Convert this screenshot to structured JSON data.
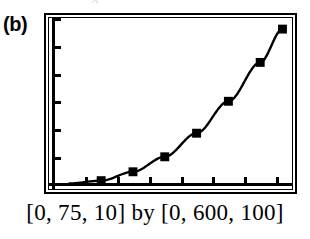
{
  "figure": {
    "panel_label": "(b)",
    "bleed_glyph": "x",
    "caption": "[0, 75, 10] by [0, 600, 100]"
  },
  "chart_data": {
    "type": "line",
    "title": "",
    "subtitle": "",
    "xlabel": "",
    "ylabel": "",
    "grid": false,
    "legend": false,
    "legend_position": "none",
    "marker": "filled-square",
    "line_style": "solid",
    "line_color": "#000000",
    "marker_color": "#000000",
    "background_color": "#ffffff",
    "window_notation": "[0, 75, 10] by [0, 600, 100]",
    "xlim": [
      0,
      75
    ],
    "ylim": [
      0,
      600
    ],
    "xtick_step": 10,
    "ytick_step": 100,
    "xticks": [
      0,
      10,
      20,
      30,
      40,
      50,
      60,
      70
    ],
    "yticks": [
      0,
      100,
      200,
      300,
      400,
      500,
      600
    ],
    "x": [
      5,
      15,
      25,
      35,
      45,
      55,
      65,
      72
    ],
    "y": [
      4,
      14,
      46,
      100,
      185,
      300,
      440,
      560
    ],
    "series": [
      {
        "name": "curve",
        "x": [
          5,
          15,
          25,
          35,
          45,
          55,
          65,
          72
        ],
        "y": [
          4,
          14,
          46,
          100,
          185,
          300,
          440,
          560
        ]
      }
    ],
    "markers": [
      {
        "x": 15,
        "y": 14
      },
      {
        "x": 25,
        "y": 46
      },
      {
        "x": 35,
        "y": 100
      },
      {
        "x": 45,
        "y": 185
      },
      {
        "x": 55,
        "y": 300
      },
      {
        "x": 65,
        "y": 440
      },
      {
        "x": 72,
        "y": 560
      }
    ]
  }
}
